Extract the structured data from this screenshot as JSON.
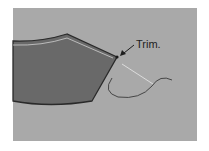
{
  "diagram": {
    "annotation": "Trim.",
    "colors": {
      "background": "#a9a9a9",
      "fabric": "#696969",
      "outline": "#2a2a2a",
      "stitch_line": "#cfcfcf",
      "thread": "#3a3a3a"
    }
  }
}
